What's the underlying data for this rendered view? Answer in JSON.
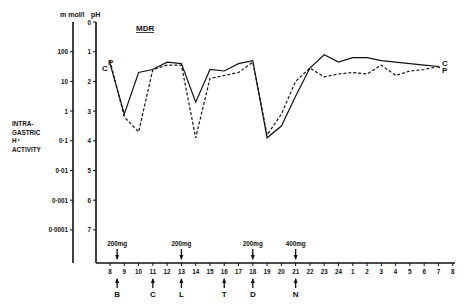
{
  "chart_data": {
    "type": "line",
    "title": "MDR",
    "ylabel": "INTRA-GASTRIC H+ ACTIVITY",
    "ylabel_lines": [
      "INTRA-",
      "GASTRIC",
      "H⁺",
      "ACTIVITY"
    ],
    "left_axis": {
      "unit": "m mol/l",
      "ticks": [
        "100",
        "10",
        "1",
        "0·1",
        "0·01",
        "0·001",
        "0·0001"
      ],
      "tick_ph_positions": [
        1,
        2,
        3,
        4,
        5,
        6,
        7
      ]
    },
    "right_axis": {
      "unit": "pH",
      "ticks": [
        "0",
        "1",
        "2",
        "3",
        "4",
        "5",
        "6",
        "7"
      ],
      "ylim": [
        0,
        7.8
      ]
    },
    "x_ticks": [
      "8",
      "9",
      "10",
      "11",
      "12",
      "13",
      "14",
      "15",
      "16",
      "17",
      "18",
      "19",
      "20",
      "21",
      "22",
      "23",
      "24",
      "1",
      "2",
      "3",
      "4",
      "5",
      "6",
      "7",
      "8"
    ],
    "x_tick_hours": [
      8,
      9,
      10,
      11,
      12,
      13,
      14,
      15,
      16,
      17,
      18,
      19,
      20,
      21,
      22,
      23,
      24,
      25,
      26,
      27,
      28,
      29,
      30,
      31,
      32
    ],
    "series": [
      {
        "name": "C",
        "style": "solid",
        "end_label": "C",
        "points": [
          [
            8,
            1.4
          ],
          [
            9,
            3.1
          ],
          [
            10,
            1.7
          ],
          [
            11,
            1.6
          ],
          [
            12,
            1.35
          ],
          [
            13,
            1.4
          ],
          [
            14,
            2.7
          ],
          [
            15,
            1.6
          ],
          [
            16,
            1.65
          ],
          [
            17,
            1.4
          ],
          [
            18,
            1.3
          ],
          [
            19,
            3.9
          ],
          [
            20,
            3.5
          ],
          [
            21,
            2.5
          ],
          [
            22,
            1.55
          ],
          [
            23,
            1.1
          ],
          [
            24,
            1.35
          ],
          [
            25,
            1.2
          ],
          [
            26,
            1.2
          ],
          [
            27,
            1.3
          ],
          [
            28,
            1.35
          ],
          [
            29,
            1.4
          ],
          [
            30,
            1.45
          ],
          [
            31,
            1.5
          ],
          [
            31.1,
            1.55
          ]
        ]
      },
      {
        "name": "P",
        "style": "dashed",
        "end_label": "P",
        "points": [
          [
            8,
            1.3
          ],
          [
            9,
            3.2
          ],
          [
            10,
            3.7
          ],
          [
            11,
            1.6
          ],
          [
            12,
            1.45
          ],
          [
            13,
            1.45
          ],
          [
            14,
            3.9
          ],
          [
            15,
            1.9
          ],
          [
            16,
            1.8
          ],
          [
            17,
            1.7
          ],
          [
            18,
            1.35
          ],
          [
            19,
            3.8
          ],
          [
            20,
            3.1
          ],
          [
            21,
            2.0
          ],
          [
            22,
            1.55
          ],
          [
            23,
            1.85
          ],
          [
            24,
            1.75
          ],
          [
            25,
            1.7
          ],
          [
            26,
            1.75
          ],
          [
            27,
            1.45
          ],
          [
            28,
            1.8
          ],
          [
            29,
            1.65
          ],
          [
            30,
            1.6
          ],
          [
            31,
            1.5
          ],
          [
            31.1,
            1.55
          ]
        ]
      }
    ],
    "start_labels": [
      "C",
      "P"
    ],
    "doses": [
      {
        "hour": 8.5,
        "dose": "200mg",
        "meal": "B"
      },
      {
        "hour": 11,
        "dose": "",
        "meal": "C"
      },
      {
        "hour": 13,
        "dose": "200mg",
        "meal": "L"
      },
      {
        "hour": 16,
        "dose": "",
        "meal": "T"
      },
      {
        "hour": 18,
        "dose": "200mg",
        "meal": "D"
      },
      {
        "hour": 21,
        "dose": "400mg",
        "meal": "N"
      }
    ],
    "grid": false,
    "legend": "inline end labels C (solid) and P (dashed)"
  }
}
